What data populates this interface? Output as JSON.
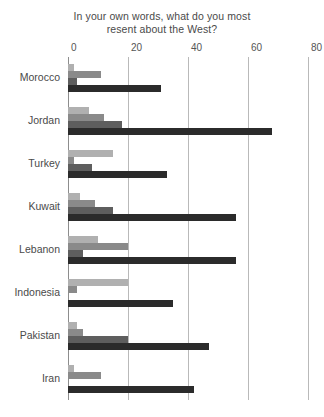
{
  "chart_data": {
    "type": "bar",
    "orientation": "horizontal",
    "title": "In your own words, what do you most resent about the West?",
    "title_line1": "In your own words, what do you most",
    "title_line2": "resent about the West?",
    "xlabel": "",
    "ylabel": "",
    "xlim": [
      0,
      80
    ],
    "xticks": [
      0,
      20,
      40,
      60,
      80
    ],
    "xticklabels": [
      "0",
      "20",
      "40",
      "60",
      "80"
    ],
    "grid": true,
    "legend": "none",
    "categories": [
      "Morocco",
      "Jordan",
      "Turkey",
      "Kuwait",
      "Lebanon",
      "Indonesia",
      "Pakistan",
      "Iran"
    ],
    "series": [
      {
        "name": "series-1",
        "color": "#b0b0b0",
        "values": [
          2,
          7,
          15,
          4,
          10,
          20,
          3,
          2
        ]
      },
      {
        "name": "series-2",
        "color": "#8a8a8a",
        "values": [
          11,
          12,
          2,
          9,
          20,
          3,
          5,
          11
        ]
      },
      {
        "name": "series-3",
        "color": "#5e5e5e",
        "values": [
          3,
          18,
          8,
          15,
          5,
          0,
          20,
          0
        ]
      },
      {
        "name": "series-4",
        "color": "#2b2b2b",
        "values": [
          31,
          68,
          33,
          56,
          56,
          35,
          47,
          42
        ]
      }
    ]
  }
}
